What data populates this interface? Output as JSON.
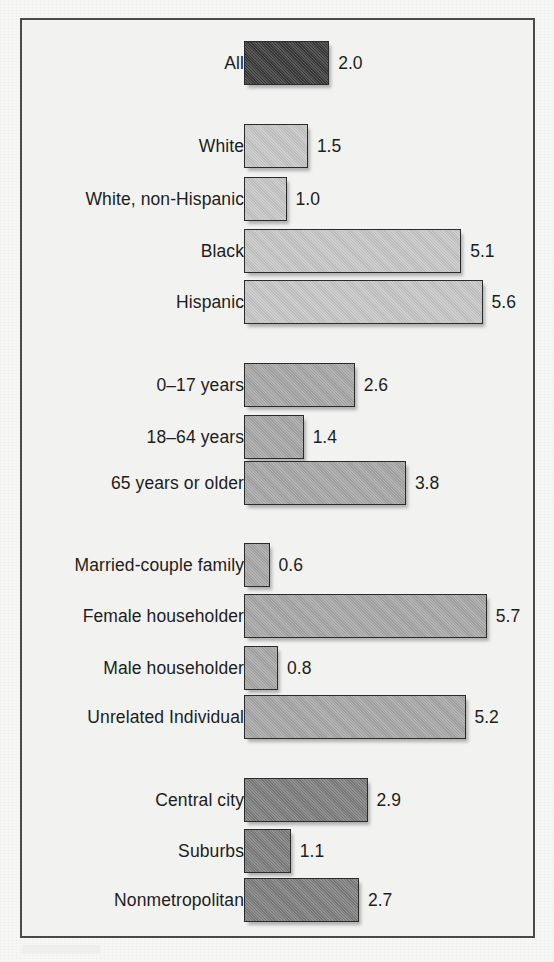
{
  "figure": {
    "background_color": "#f2f2f0",
    "frame_color": "#4a4a4a",
    "bar_outline_color": "#2b2b2b",
    "text_color": "#1d1d1d"
  },
  "chart_data": {
    "type": "bar",
    "orientation": "horizontal",
    "title": "",
    "subtitle": "",
    "xlabel": "",
    "ylabel": "",
    "grid": false,
    "legend": "none",
    "axis_visible": false,
    "value_labels_shown": true,
    "xlim": [
      0,
      6.0
    ],
    "px_per_unit": 42.6,
    "baseline_x_px": 244,
    "categories": [
      "All",
      "White",
      "White, non-Hispanic",
      "Black",
      "Hispanic",
      "0–17 years",
      "18–64 years",
      "65 years or older",
      "Married-couple family",
      "Female householder",
      "Male householder",
      "Unrelated Individual",
      "Central city",
      "Suburbs",
      "Nonmetropolitan"
    ],
    "values": [
      2.0,
      1.5,
      1.0,
      5.1,
      5.6,
      2.6,
      1.4,
      3.8,
      0.6,
      5.7,
      0.8,
      5.2,
      2.9,
      1.1,
      2.7
    ],
    "value_labels": [
      "2.0",
      "1.5",
      "1.0",
      "5.1",
      "5.6",
      "2.6",
      "1.4",
      "3.8",
      "0.6",
      "5.7",
      "0.8",
      "5.2",
      "2.9",
      "1.1",
      "2.7"
    ],
    "groups": [
      {
        "name": "overall",
        "fill_color": "#3a3a3a",
        "bars": [
          {
            "label": "All",
            "value": 2.0,
            "value_label": "2.0",
            "center_y": 63,
            "bar_height": 44
          }
        ]
      },
      {
        "name": "race-ethnicity",
        "fill_color": "#c6c6c6",
        "bars": [
          {
            "label": "White",
            "value": 1.5,
            "value_label": "1.5",
            "center_y": 146,
            "bar_height": 44
          },
          {
            "label": "White, non-Hispanic",
            "value": 1.0,
            "value_label": "1.0",
            "center_y": 199,
            "bar_height": 44
          },
          {
            "label": "Black",
            "value": 5.1,
            "value_label": "5.1",
            "center_y": 251,
            "bar_height": 44
          },
          {
            "label": "Hispanic",
            "value": 5.6,
            "value_label": "5.6",
            "center_y": 302,
            "bar_height": 44
          }
        ]
      },
      {
        "name": "age",
        "fill_color": "#a6a6a6",
        "bars": [
          {
            "label": "0–17 years",
            "value": 2.6,
            "value_label": "2.6",
            "center_y": 385,
            "bar_height": 44
          },
          {
            "label": "18–64 years",
            "value": 1.4,
            "value_label": "1.4",
            "center_y": 437,
            "bar_height": 44
          },
          {
            "label": "65 years or older",
            "value": 3.8,
            "value_label": "3.8",
            "center_y": 483,
            "bar_height": 44
          }
        ]
      },
      {
        "name": "household-type",
        "fill_color": "#a6a6a6",
        "bars": [
          {
            "label": "Married-couple family",
            "value": 0.6,
            "value_label": "0.6",
            "center_y": 565,
            "bar_height": 44
          },
          {
            "label": "Female householder",
            "value": 5.7,
            "value_label": "5.7",
            "center_y": 616,
            "bar_height": 44
          },
          {
            "label": "Male householder",
            "value": 0.8,
            "value_label": "0.8",
            "center_y": 668,
            "bar_height": 44
          },
          {
            "label": "Unrelated Individual",
            "value": 5.2,
            "value_label": "5.2",
            "center_y": 717,
            "bar_height": 44
          }
        ]
      },
      {
        "name": "residence",
        "fill_color": "#7d7d7d",
        "bars": [
          {
            "label": "Central city",
            "value": 2.9,
            "value_label": "2.9",
            "center_y": 800,
            "bar_height": 44
          },
          {
            "label": "Suburbs",
            "value": 1.1,
            "value_label": "1.1",
            "center_y": 851,
            "bar_height": 44
          },
          {
            "label": "Nonmetropolitan",
            "value": 2.7,
            "value_label": "2.7",
            "center_y": 900,
            "bar_height": 44
          }
        ]
      }
    ]
  }
}
